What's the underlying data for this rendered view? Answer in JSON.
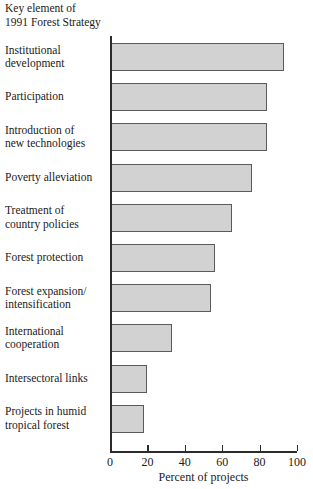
{
  "header": {
    "title": "Key element of\n1991 Forest Strategy"
  },
  "chart_data": {
    "type": "bar",
    "orientation": "horizontal",
    "title": "Key element of 1991 Forest Strategy",
    "xlabel": "Percent of projects",
    "ylabel": "",
    "xlim": [
      0,
      100
    ],
    "xticks": [
      0,
      20,
      40,
      60,
      80,
      100
    ],
    "grid": false,
    "legend": null,
    "bar_color": "#d2d2d2",
    "bar_border_color": "#5a5a5a",
    "categories": [
      "Institutional\ndevelopment",
      "Participation",
      "Introduction of\nnew technologies",
      "Poverty alleviation",
      "Treatment of\ncountry policies",
      "Forest protection",
      "Forest expansion/\nintensification",
      "International\ncooperation",
      "Intersectoral links",
      "Projects in humid\ntropical forest"
    ],
    "values": [
      93,
      84,
      84,
      76,
      65,
      56,
      54,
      33,
      20,
      18
    ]
  }
}
